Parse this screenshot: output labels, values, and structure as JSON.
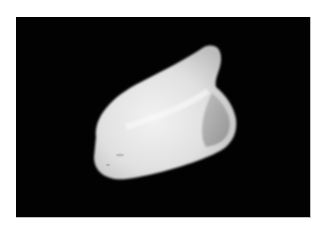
{
  "image": {
    "subject": "white tooth-like object on black background",
    "background_color": "#020202",
    "object_color": "#e8e8e8",
    "shadow_color": "#8a8a8a"
  }
}
